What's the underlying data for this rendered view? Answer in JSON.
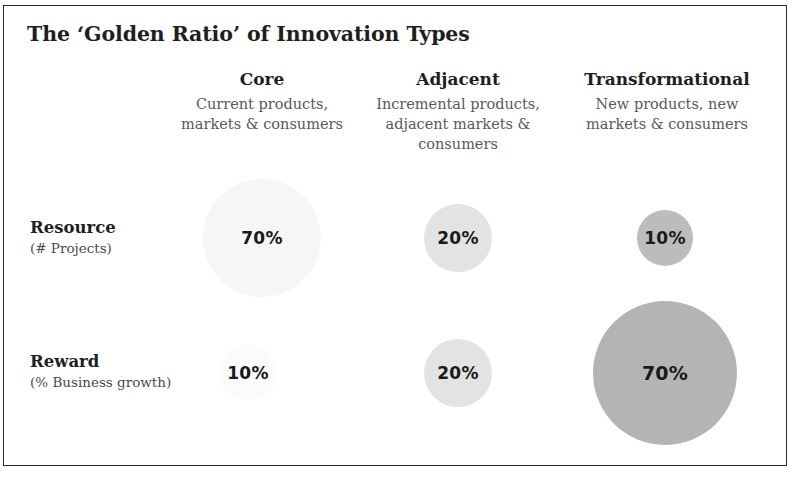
{
  "figure": {
    "title": "The ‘Golden Ratio’ of Innovation Types",
    "background_color": "#ffffff",
    "border_color": "#2b2b2b"
  },
  "columns": [
    {
      "key": "core",
      "title": "Core",
      "subtitle_line1": "Current products,",
      "subtitle_line2": "markets & consumers",
      "subtitle_line3": ""
    },
    {
      "key": "adjacent",
      "title": "Adjacent",
      "subtitle_line1": "Incremental products,",
      "subtitle_line2": "adjacent markets &",
      "subtitle_line3": "consumers"
    },
    {
      "key": "transformational",
      "title": "Transformational",
      "subtitle_line1": "New products, new",
      "subtitle_line2": "markets & consumers",
      "subtitle_line3": ""
    }
  ],
  "rows": [
    {
      "key": "resource",
      "title": "Resource",
      "subtitle": "(# Projects)"
    },
    {
      "key": "reward",
      "title": "Reward",
      "subtitle": "(% Business growth)"
    }
  ],
  "bubbles": {
    "resource_core": {
      "label": "70%",
      "value": 70,
      "diameter": 118,
      "cx": 262,
      "cy": 238,
      "color": "#f6f6f6"
    },
    "resource_adjacent": {
      "label": "20%",
      "value": 20,
      "diameter": 68,
      "cx": 458,
      "cy": 238,
      "color": "#e3e3e3"
    },
    "resource_transformational": {
      "label": "10%",
      "value": 10,
      "diameter": 56,
      "cx": 665,
      "cy": 238,
      "color": "#bcbcbc"
    },
    "reward_core": {
      "label": "10%",
      "value": 10,
      "diameter": 56,
      "cx": 248,
      "cy": 373,
      "color": "#fbfbfb"
    },
    "reward_adjacent": {
      "label": "20%",
      "value": 20,
      "diameter": 68,
      "cx": 458,
      "cy": 373,
      "color": "#e3e3e3"
    },
    "reward_transformational": {
      "label": "70%",
      "value": 70,
      "diameter": 144,
      "cx": 665,
      "cy": 373,
      "color": "#b4b4b4"
    }
  },
  "chart_data": {
    "type": "bubble",
    "title": "The ‘Golden Ratio’ of Innovation Types",
    "xlabel": "",
    "ylabel": "",
    "grid": false,
    "legend": "none",
    "categories": [
      "Core",
      "Adjacent",
      "Transformational"
    ],
    "category_descriptions": [
      "Current products, markets & consumers",
      "Incremental products, adjacent markets & consumers",
      "New products, new markets & consumers"
    ],
    "series": [
      {
        "name": "Resource (# Projects)",
        "values": [
          70,
          20,
          10
        ],
        "value_labels": [
          "70%",
          "20%",
          "10%"
        ]
      },
      {
        "name": "Reward (% Business growth)",
        "values": [
          10,
          20,
          70
        ],
        "value_labels": [
          "10%",
          "20%",
          "70%"
        ]
      }
    ],
    "units": "percent"
  }
}
